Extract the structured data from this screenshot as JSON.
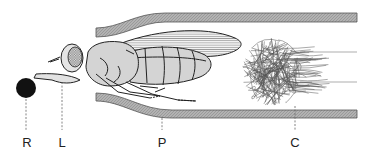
{
  "figure": {
    "labels": [
      {
        "id": "R",
        "text": "R"
      },
      {
        "id": "L",
        "text": "L"
      },
      {
        "id": "P",
        "text": "P"
      },
      {
        "id": "C",
        "text": "C"
      }
    ],
    "parts": {
      "R": "black-ball",
      "L": "proboscis/leg extension",
      "P": "tube-wall",
      "C": "cotton-plug"
    },
    "colors": {
      "wall": "#a9a9a9",
      "body": "#d4d4d4",
      "ball": "#111111",
      "ink": "#222222"
    }
  }
}
